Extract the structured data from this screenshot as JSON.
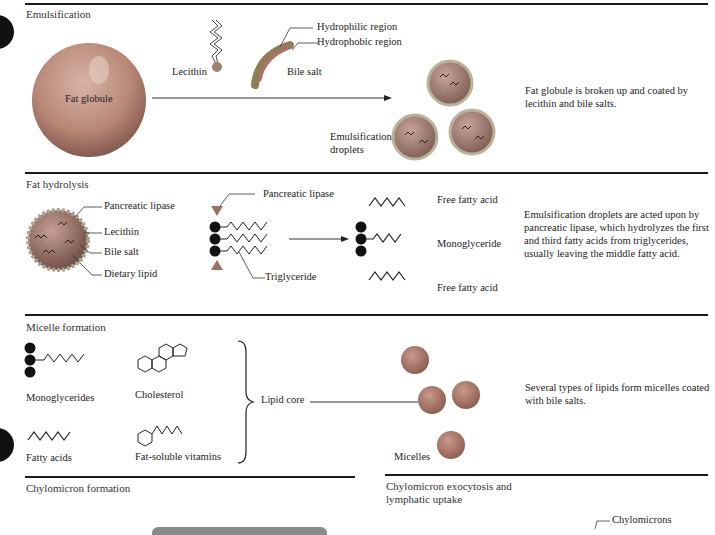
{
  "sections": [
    {
      "id": "emulsification",
      "title": "Emulsification",
      "labels": {
        "fat_globule": "Fat globule",
        "lecithin": "Lecithin",
        "bile_salt": "Bile salt",
        "hydrophilic": "Hydrophilic region",
        "hydrophobic": "Hydrophobic region",
        "droplets_line1": "Emulsification",
        "droplets_line2": "droplets"
      },
      "description": "Fat globule is broken up and coated by lecithin and bile salts."
    },
    {
      "id": "fat-hydrolysis",
      "title": "Fat hydrolysis",
      "labels": {
        "pancreatic_lipase": "Pancreatic lipase",
        "lecithin": "Lecithin",
        "bile_salt": "Bile salt",
        "dietary_lipid": "Dietary lipid",
        "pancreatic_lipase_2": "Pancreatic lipase",
        "triglyceride": "Triglyceride",
        "free_fatty_acid_top": "Free fatty acid",
        "monoglyceride": "Monoglyceride",
        "free_fatty_acid_bottom": "Free fatty acid"
      },
      "description": "Emulsification droplets are acted upon by pancreatic lipase, which hydrolyzes the first and third fatty acids from triglycerides, usually leaving the middle fatty acid."
    },
    {
      "id": "micelle-formation",
      "title": "Micelle formation",
      "labels": {
        "monoglycerides": "Monoglycerides",
        "cholesterol": "Cholesterol",
        "fatty_acids": "Fatty acids",
        "fat_soluble_vitamins": "Fat-soluble vitamins",
        "lipid_core": "Lipid core",
        "micelles": "Micelles"
      },
      "description": "Several types of lipids form micelles coated with bile salts."
    },
    {
      "id": "chylomicron-formation",
      "title": "Chylomicron formation"
    },
    {
      "id": "chylomicron-exocytosis",
      "title_line1": "Chylomicron exocytosis and",
      "title_line2": "lymphatic uptake",
      "labels": {
        "chylomicrons": "Chylomicrons"
      }
    }
  ],
  "colors": {
    "rule": "#1a1a1a",
    "globule": "#b98a7c",
    "droplet": "#a9807a",
    "micelle": "#b4705f",
    "glycerol": "#111111",
    "lipase": "#9a7066",
    "bile_salt": "#9c8a5a"
  }
}
